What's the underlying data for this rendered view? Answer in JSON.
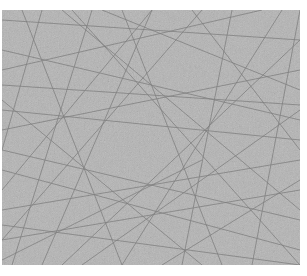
{
  "image": {
    "subject": "gray texture with many thin crisscrossing lines",
    "background_color": "#b4b4b4",
    "line_color": "#6e6e6e",
    "lines": [
      [
        0,
        40,
        298,
        110
      ],
      [
        0,
        120,
        298,
        60
      ],
      [
        20,
        0,
        120,
        255
      ],
      [
        60,
        0,
        298,
        200
      ],
      [
        0,
        200,
        298,
        150
      ],
      [
        150,
        0,
        40,
        255
      ],
      [
        0,
        90,
        200,
        255
      ],
      [
        100,
        0,
        298,
        80
      ],
      [
        0,
        10,
        298,
        30
      ],
      [
        230,
        0,
        180,
        255
      ],
      [
        0,
        160,
        298,
        240
      ],
      [
        280,
        0,
        120,
        255
      ],
      [
        0,
        230,
        298,
        180
      ],
      [
        40,
        0,
        0,
        140
      ],
      [
        0,
        60,
        260,
        0
      ],
      [
        190,
        0,
        298,
        140
      ],
      [
        0,
        250,
        200,
        150
      ],
      [
        80,
        255,
        298,
        100
      ],
      [
        0,
        140,
        298,
        210
      ],
      [
        120,
        0,
        220,
        255
      ],
      [
        0,
        180,
        150,
        0
      ],
      [
        298,
        30,
        60,
        255
      ],
      [
        0,
        75,
        298,
        95
      ],
      [
        160,
        255,
        298,
        170
      ],
      [
        0,
        215,
        298,
        255
      ],
      [
        250,
        255,
        298,
        0
      ],
      [
        10,
        255,
        90,
        0
      ],
      [
        0,
        100,
        298,
        130
      ],
      [
        200,
        0,
        0,
        230
      ],
      [
        70,
        0,
        298,
        255
      ]
    ]
  }
}
